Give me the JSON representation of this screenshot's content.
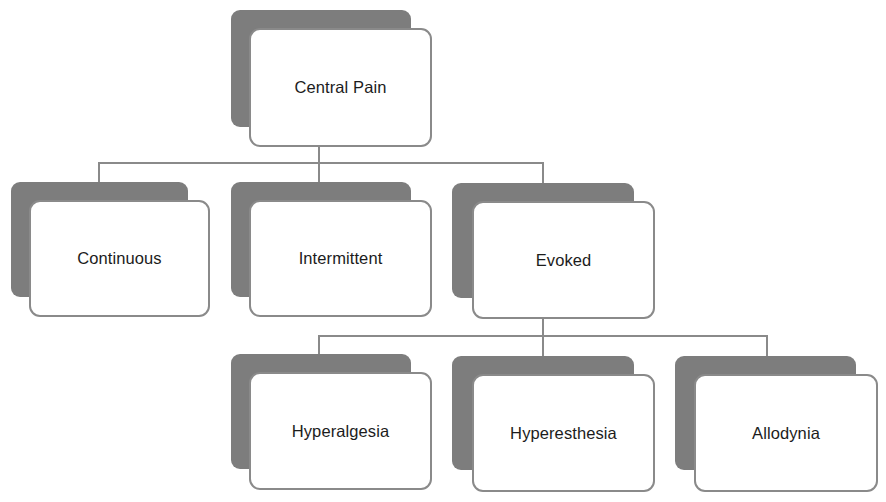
{
  "diagram": {
    "type": "hierarchy-tree",
    "root": {
      "id": "central-pain",
      "label": "Central Pain"
    },
    "level1": [
      {
        "id": "continuous",
        "label": "Continuous"
      },
      {
        "id": "intermittent",
        "label": "Intermittent"
      },
      {
        "id": "evoked",
        "label": "Evoked"
      }
    ],
    "level2": [
      {
        "id": "hyperalgesia",
        "label": "Hyperalgesia",
        "parent": "evoked"
      },
      {
        "id": "hyperesthesia",
        "label": "Hyperesthesia",
        "parent": "evoked"
      },
      {
        "id": "allodynia",
        "label": "Allodynia",
        "parent": "evoked"
      }
    ],
    "edges": [
      [
        "central-pain",
        "continuous"
      ],
      [
        "central-pain",
        "intermittent"
      ],
      [
        "central-pain",
        "evoked"
      ],
      [
        "evoked",
        "hyperalgesia"
      ],
      [
        "evoked",
        "hyperesthesia"
      ],
      [
        "evoked",
        "allodynia"
      ]
    ],
    "colors": {
      "shadow": "#7d7d7d",
      "box_fill": "#ffffff",
      "box_border": "#8a8a8a",
      "connector": "#8a8a8a",
      "text": "#1c1c1c"
    }
  }
}
